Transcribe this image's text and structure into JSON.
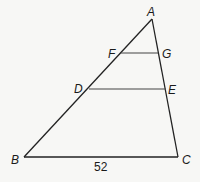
{
  "diagram": {
    "type": "triangle-with-parallel-segments",
    "points": {
      "A": {
        "label": "A",
        "x": 152,
        "y": 19
      },
      "B": {
        "label": "B",
        "x": 24,
        "y": 157
      },
      "C": {
        "label": "C",
        "x": 178,
        "y": 157
      },
      "D": {
        "label": "D",
        "x": 89,
        "y": 89
      },
      "E": {
        "label": "E",
        "x": 166,
        "y": 89
      },
      "F": {
        "label": "F",
        "x": 121,
        "y": 53
      },
      "G": {
        "label": "G",
        "x": 158,
        "y": 53
      }
    },
    "segments": [
      {
        "from": "A",
        "to": "B"
      },
      {
        "from": "A",
        "to": "C"
      },
      {
        "from": "B",
        "to": "C",
        "length_label": "52"
      },
      {
        "from": "D",
        "to": "E"
      },
      {
        "from": "F",
        "to": "G"
      }
    ],
    "measure_BC": "52",
    "line_color": "#222222"
  }
}
